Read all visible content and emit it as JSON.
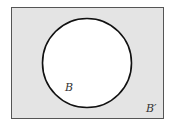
{
  "diagram": {
    "type": "venn",
    "universe_label": "B′",
    "sets": [
      {
        "name": "B",
        "label": "B",
        "fill": "#ffffff"
      }
    ],
    "colors": {
      "universe_fill": "#e4e4e4",
      "border": "#555555",
      "circle_stroke": "#111111",
      "set_fill": "#ffffff"
    }
  }
}
